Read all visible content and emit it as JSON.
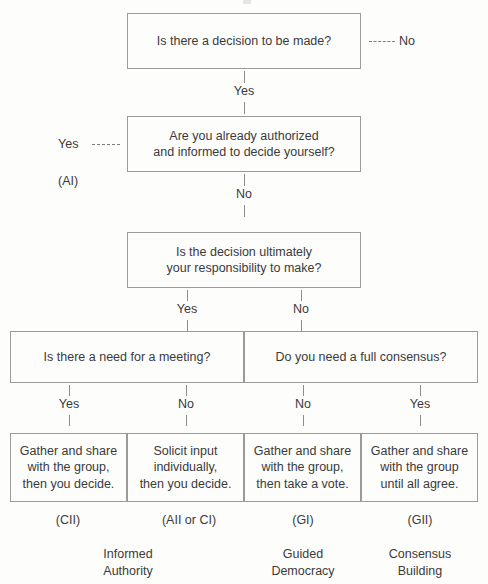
{
  "decision_tree": {
    "questions": [
      {
        "id": "q1",
        "text": "Is there a decision to be made?"
      },
      {
        "id": "q2",
        "line1": "Are you already authorized",
        "line2": "and informed to decide yourself?"
      },
      {
        "id": "q3",
        "line1": "Is the decision ultimately",
        "line2": "your responsibility to make?"
      },
      {
        "id": "q4",
        "text": "Is there a need for a meeting?"
      },
      {
        "id": "q5",
        "text": "Do you need a full consensus?"
      }
    ],
    "outcomes": [
      {
        "line1": "Gather and share",
        "line2": "with the group,",
        "line3": "then you decide.",
        "code": "(CII)",
        "style_name_line1": "Informed",
        "style_name_line2": "Authority"
      },
      {
        "line1": "Solicit input",
        "line2": "individually,",
        "line3": "then you decide.",
        "code": "(AII or CI)"
      },
      {
        "line1": "Gather and share",
        "line2": "with the group,",
        "line3": "then take a vote.",
        "code": "(GI)",
        "style_name_line1": "Guided",
        "style_name_line2": "Democracy"
      },
      {
        "line1": "Gather and share",
        "line2": "with the group",
        "line3": "until all agree.",
        "code": "(GII)",
        "style_name_line1": "Consensus",
        "style_name_line2": "Building"
      }
    ],
    "connectors": {
      "q1_to_q2": "Yes",
      "q1_no_branch": "No",
      "q2_yes_branch": "Yes",
      "q2_yes_code": "(AI)",
      "q2_to_q3": "No",
      "q3_yes": "Yes",
      "q3_no": "No",
      "q4_yes": "Yes",
      "q4_no": "No",
      "q5_no": "No",
      "q5_yes": "Yes"
    }
  },
  "colors": {
    "border": "#9a9a9a",
    "text": "#3a3a3a",
    "background": "#fdfdfc"
  }
}
